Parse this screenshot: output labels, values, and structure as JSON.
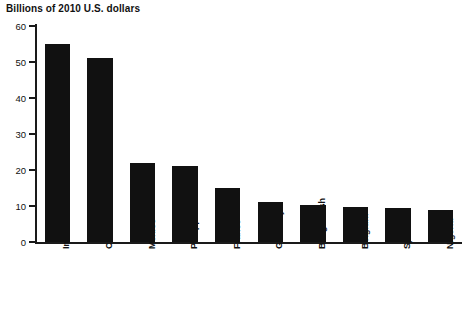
{
  "chart_data": {
    "type": "bar",
    "title": "Billions of 2010 U.S. dollars",
    "xlabel": "",
    "ylabel": "",
    "ylim": [
      0,
      60
    ],
    "yticks": [
      0,
      10,
      20,
      30,
      40,
      50,
      60
    ],
    "grid": false,
    "legend": "none",
    "bar_color": "#111111",
    "axis_color": "#1a1a1a",
    "categories": [
      "India",
      "China",
      "Mexico",
      "Philippines",
      "France",
      "Germany",
      "Bangladesh",
      "Belgium",
      "Spain",
      "Nigeria"
    ],
    "values": [
      55,
      51,
      22,
      21,
      15,
      11,
      10.3,
      9.7,
      9.5,
      9
    ]
  }
}
